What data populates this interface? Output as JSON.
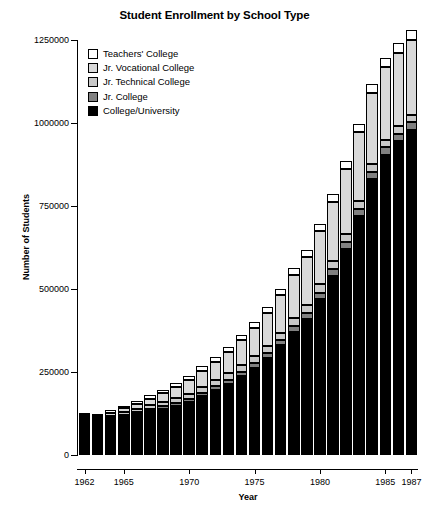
{
  "chart_data": {
    "type": "bar",
    "stacked": true,
    "title": "Student Enrollment by School Type",
    "xlabel": "Year",
    "ylabel": "Number of Students",
    "ylim": [
      0,
      1250000
    ],
    "ytick_labels": [
      "0",
      "250000",
      "500000",
      "750000",
      "1000000",
      "1250000"
    ],
    "ytick_values": [
      0,
      250000,
      500000,
      750000,
      1000000,
      1250000
    ],
    "grid": false,
    "legend_position": "upper left inside",
    "categories": [
      "1962",
      "1963",
      "1964",
      "1965",
      "1966",
      "1967",
      "1968",
      "1969",
      "1970",
      "1971",
      "1972",
      "1973",
      "1974",
      "1975",
      "1976",
      "1977",
      "1978",
      "1979",
      "1980",
      "1981",
      "1982",
      "1983",
      "1984",
      "1985",
      "1986",
      "1987"
    ],
    "xtick_labels": [
      "1962",
      "1965",
      "1970",
      "1975",
      "1980",
      "1985",
      "1987"
    ],
    "xtick_categories": [
      "1962",
      "1965",
      "1970",
      "1975",
      "1980",
      "1985",
      "1987"
    ],
    "series": [
      {
        "name": "College/University",
        "color": "#000000",
        "values": [
          108000,
          104000,
          110000,
          118000,
          125000,
          133000,
          140000,
          148000,
          160000,
          178000,
          196000,
          215000,
          238000,
          262000,
          292000,
          330000,
          372000,
          410000,
          470000,
          540000,
          620000,
          720000,
          830000,
          905000,
          945000,
          980000
        ]
      },
      {
        "name": "Jr. College",
        "color": "#808080",
        "values": [
          3000,
          3000,
          3000,
          4000,
          5000,
          6000,
          7000,
          8000,
          9000,
          10000,
          11000,
          12000,
          13000,
          14000,
          15000,
          16000,
          17000,
          18000,
          19000,
          20000,
          21000,
          22000,
          22000,
          22000,
          22000,
          22000
        ]
      },
      {
        "name": "Jr. Technical College",
        "color": "#c8c8c8",
        "values": [
          4000,
          5000,
          6000,
          7000,
          9000,
          11000,
          13000,
          15000,
          16000,
          17000,
          18000,
          19000,
          20000,
          21000,
          22000,
          23000,
          24000,
          25000,
          25000,
          25000,
          25000,
          24000,
          24000,
          23000,
          23000,
          23000
        ]
      },
      {
        "name": "Jr. Vocational College",
        "color": "#d9d9d9",
        "values": [
          6000,
          7000,
          9000,
          12000,
          16000,
          20000,
          26000,
          33000,
          40000,
          48000,
          56000,
          64000,
          74000,
          85000,
          98000,
          112000,
          128000,
          144000,
          160000,
          178000,
          194000,
          206000,
          214000,
          218000,
          222000,
          226000
        ]
      },
      {
        "name": "Teachers' College",
        "color": "#ffffff",
        "values": [
          6000,
          6000,
          7000,
          8000,
          9000,
          10000,
          11000,
          12000,
          13000,
          14000,
          15000,
          16000,
          17000,
          18000,
          19000,
          20000,
          21000,
          22000,
          23000,
          24000,
          25000,
          26000,
          27000,
          28000,
          29000,
          30000
        ]
      }
    ],
    "legend": [
      {
        "label": "Teachers' College",
        "color": "#ffffff"
      },
      {
        "label": "Jr. Vocational College",
        "color": "#d9d9d9"
      },
      {
        "label": "Jr. Technical College",
        "color": "#c8c8c8"
      },
      {
        "label": "Jr. College",
        "color": "#808080"
      },
      {
        "label": "College/University",
        "color": "#000000"
      }
    ]
  }
}
